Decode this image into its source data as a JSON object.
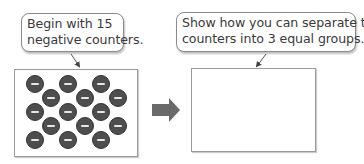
{
  "left_step": {
    "bubble_lines": [
      "Begin with 15",
      "negative counters."
    ],
    "counter_count": 15,
    "counter_sign": "−",
    "counter_color": "#4e4e4e"
  },
  "right_step": {
    "bubble_lines": [
      "Show how you can separate the",
      "counters into 3 equal groups."
    ],
    "answer_box": "empty"
  },
  "arrow": {
    "icon": "right-arrow-icon",
    "color": "#6a6a6a"
  }
}
